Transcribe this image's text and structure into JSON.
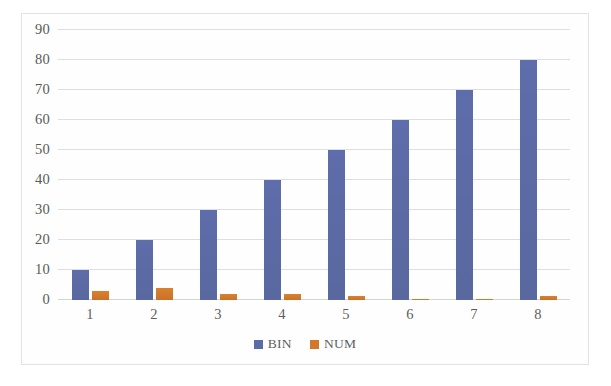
{
  "chart_data": {
    "type": "bar",
    "title": "",
    "subtitle": "",
    "xlabel": "",
    "ylabel": "",
    "categories": [
      "1",
      "2",
      "3",
      "4",
      "5",
      "6",
      "7",
      "8"
    ],
    "series": [
      {
        "name": "BIN",
        "color": "#5b6ba8",
        "values": [
          10,
          20,
          30,
          40,
          50,
          60,
          70,
          80
        ]
      },
      {
        "name": "NUM",
        "color": "#d2782c",
        "values": [
          3,
          4,
          2,
          2,
          1.5,
          0.4,
          0.4,
          1.5
        ]
      }
    ],
    "ylim": [
      0,
      90
    ],
    "yticks": [
      0,
      10,
      20,
      30,
      40,
      50,
      60,
      70,
      80,
      90
    ],
    "ytick_labels": [
      "0",
      "10",
      "20",
      "30",
      "40",
      "50",
      "60",
      "70",
      "80",
      "90"
    ],
    "grid": true,
    "grid_axis": "y",
    "legend": true,
    "legend_position": "bottom",
    "legend_entries": [
      "BIN",
      "NUM"
    ],
    "annotations": []
  },
  "colors": {
    "bin": "#5b6ba8",
    "num": "#d2782c",
    "grid": "#dcdee2",
    "frame_border": "#e2e3e6",
    "tick_text": "#5e5e5e",
    "background": "#ffffff"
  }
}
